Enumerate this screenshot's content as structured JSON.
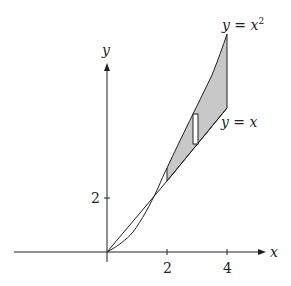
{
  "figure": {
    "axes": {
      "x_label": "x",
      "y_label": "y",
      "x_ticks": [
        {
          "value": 2,
          "label": "2"
        },
        {
          "value": 4,
          "label": "4"
        }
      ],
      "y_ticks": [
        {
          "value": 2,
          "label": "2"
        }
      ]
    },
    "curves": [
      {
        "name": "parabola",
        "label": "y = x",
        "superscript": "2"
      },
      {
        "name": "line",
        "label": "y = x"
      }
    ],
    "shaded_region": {
      "x_from": 2,
      "x_to": 4,
      "between": [
        "y = x",
        "y = x^2"
      ],
      "fill": "#c8c8c8"
    },
    "sample_rectangle": {
      "x": 3,
      "description": "representative vertical strip"
    },
    "colors": {
      "stroke": "#222222",
      "shade": "#c8c8c8",
      "background": "#ffffff"
    }
  }
}
